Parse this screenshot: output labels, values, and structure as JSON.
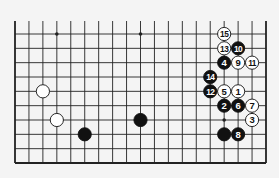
{
  "diagram": {
    "type": "go-board-fragment",
    "columns": 19,
    "rows": 10,
    "open_edge": "top",
    "colors": {
      "background": "#f4f4f4",
      "line": "#222222",
      "black_stone": "#111111",
      "white_stone": "#ffffff",
      "black_label": "#ffffff",
      "white_label": "#111111"
    },
    "star_points": [
      {
        "col": 3,
        "row": 0
      },
      {
        "col": 9,
        "row": 0
      },
      {
        "col": 15,
        "row": 6
      }
    ],
    "stones": [
      {
        "color": "white",
        "col": 2,
        "row": 4,
        "label": ""
      },
      {
        "color": "white",
        "col": 3,
        "row": 6,
        "label": ""
      },
      {
        "color": "black",
        "col": 5,
        "row": 7,
        "label": ""
      },
      {
        "color": "black",
        "col": 9,
        "row": 6,
        "label": ""
      },
      {
        "color": "black",
        "col": 15,
        "row": 7,
        "label": ""
      },
      {
        "color": "white",
        "col": 16,
        "row": 4,
        "label": "1"
      },
      {
        "color": "black",
        "col": 15,
        "row": 5,
        "label": "2"
      },
      {
        "color": "white",
        "col": 17,
        "row": 6,
        "label": "3"
      },
      {
        "color": "black",
        "col": 15,
        "row": 2,
        "label": "4"
      },
      {
        "color": "white",
        "col": 15,
        "row": 4,
        "label": "5"
      },
      {
        "color": "black",
        "col": 16,
        "row": 5,
        "label": "6"
      },
      {
        "color": "white",
        "col": 17,
        "row": 5,
        "label": "7"
      },
      {
        "color": "black",
        "col": 16,
        "row": 7,
        "label": "8"
      },
      {
        "color": "white",
        "col": 16,
        "row": 2,
        "label": "9"
      },
      {
        "color": "black",
        "col": 16,
        "row": 1,
        "label": "10"
      },
      {
        "color": "white",
        "col": 17,
        "row": 2,
        "label": "11"
      },
      {
        "color": "black",
        "col": 14,
        "row": 4,
        "label": "12"
      },
      {
        "color": "white",
        "col": 15,
        "row": 1,
        "label": "13"
      },
      {
        "color": "black",
        "col": 14,
        "row": 3,
        "label": "14"
      },
      {
        "color": "white",
        "col": 15,
        "row": 0,
        "label": "15"
      }
    ]
  }
}
